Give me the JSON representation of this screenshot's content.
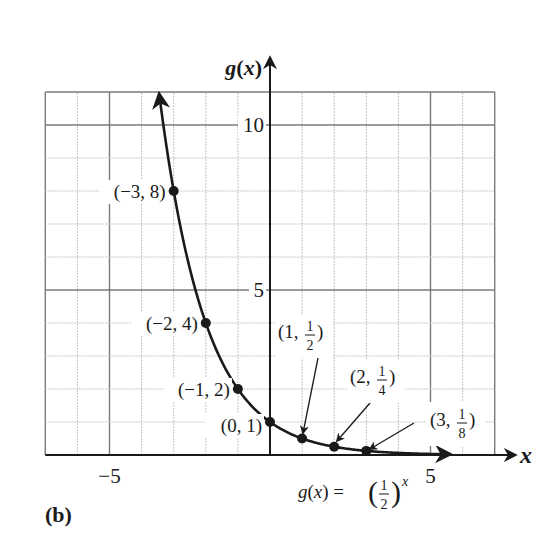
{
  "chart_data": {
    "type": "line",
    "title": "",
    "xlabel": "x",
    "ylabel": "g(x)",
    "function_label": "g(x) = (1/2)^x",
    "function_label_parts": {
      "lhs": "g(x) = ",
      "num": "1",
      "den": "2",
      "exp": "x"
    },
    "xlim": [
      -7,
      7
    ],
    "ylim": [
      0,
      11
    ],
    "grid": true,
    "major_grid_every": 5,
    "x_tick_labels": [
      {
        "value": -5,
        "label": "−5"
      },
      {
        "value": 5,
        "label": "5"
      }
    ],
    "y_tick_labels": [
      {
        "value": 5,
        "label": "5"
      },
      {
        "value": 10,
        "label": "10"
      }
    ],
    "points": [
      {
        "x": -3,
        "y": 8,
        "label": "(−3, 8)"
      },
      {
        "x": -2,
        "y": 4,
        "label": "(−2, 4)"
      },
      {
        "x": -1,
        "y": 2,
        "label": "(−1, 2)"
      },
      {
        "x": 0,
        "y": 1,
        "label": "(0, 1)"
      },
      {
        "x": 1,
        "y": 0.5,
        "label": "(1, 1/2)",
        "lead": "(1, ",
        "num": "1",
        "den": "2"
      },
      {
        "x": 2,
        "y": 0.25,
        "label": "(2, 1/4)",
        "lead": "(2, ",
        "num": "1",
        "den": "4"
      },
      {
        "x": 3,
        "y": 0.125,
        "label": "(3, 1/8)",
        "lead": "(3, ",
        "num": "1",
        "den": "8"
      }
    ],
    "series": [
      {
        "name": "g(x) = (1/2)^x",
        "x": [
          -3,
          -2,
          -1,
          0,
          1,
          2,
          3
        ],
        "values": [
          8,
          4,
          2,
          1,
          0.5,
          0.25,
          0.125
        ]
      }
    ],
    "curve_domain": [
      -3.45,
      5.6
    ]
  },
  "figure": {
    "caption": "(b)",
    "axis_x_label": "x",
    "axis_y_label": "g(x)"
  }
}
